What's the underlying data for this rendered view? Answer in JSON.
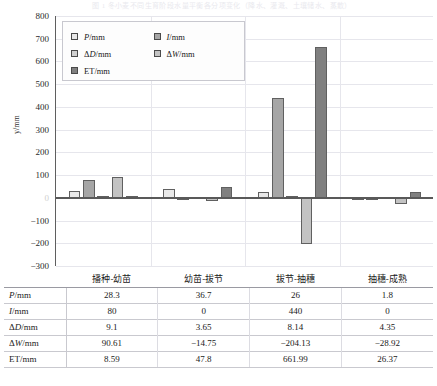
{
  "caption": "图 1  冬小麦不同生育阶段水量平衡各分项变化（降水、灌溉、土壤储水、蒸散）",
  "chart_data": {
    "type": "bar",
    "title": "",
    "xlabel": "",
    "ylabel": "y/mm",
    "ylim": [
      -300,
      800
    ],
    "ystep": 100,
    "grid": true,
    "legend_position": "top-left-inside",
    "categories": [
      "播种-幼苗",
      "幼苗-拔节",
      "拔节-抽穗",
      "抽穗-成熟"
    ],
    "yticks": [
      "800",
      "700",
      "600",
      "500",
      "400",
      "300",
      "200",
      "100",
      "0",
      "-100",
      "-200",
      "-300"
    ],
    "series": [
      {
        "name": "P/mm",
        "color": "#e8e8e8",
        "values": [
          28.3,
          36.7,
          26,
          1.8
        ]
      },
      {
        "name": "I/mm",
        "color": "#a6a6a6",
        "values": [
          80,
          0,
          440,
          0
        ]
      },
      {
        "name": "ΔD/mm",
        "color": "#d0d0d0",
        "values": [
          9.1,
          3.65,
          8.14,
          4.35
        ]
      },
      {
        "name": "ΔW/mm",
        "color": "#c3c3c3",
        "values": [
          90.61,
          -14.75,
          -204.13,
          -28.92
        ]
      },
      {
        "name": "ET/mm",
        "color": "#808080",
        "values": [
          8.59,
          47.8,
          661.99,
          26.37
        ]
      }
    ]
  },
  "legend": {
    "items": [
      {
        "label_html": "P/mm",
        "swatch": "#e8e8e8"
      },
      {
        "label_html": "I/mm",
        "swatch": "#a6a6a6"
      },
      {
        "label_html": "ΔD/mm",
        "swatch": "#d0d0d0"
      },
      {
        "label_html": "ΔW/mm",
        "swatch": "#c3c3c3"
      },
      {
        "label_html": "ET/mm",
        "swatch": "#808080"
      }
    ]
  },
  "table": {
    "corner": "",
    "columns": [
      "播种-幼苗",
      "幼苗-拔节",
      "拔节-抽穗",
      "抽穗-成熟"
    ],
    "rows": [
      {
        "label": "P/mm",
        "values": [
          "28.3",
          "36.7",
          "26",
          "1.8"
        ]
      },
      {
        "label": "I/mm",
        "values": [
          "80",
          "0",
          "440",
          "0"
        ]
      },
      {
        "label": "ΔD/mm",
        "values": [
          "9.1",
          "3.65",
          "8.14",
          "4.35"
        ]
      },
      {
        "label": "ΔW/mm",
        "values": [
          "90.61",
          "−14.75",
          "−204.13",
          "−28.92"
        ]
      },
      {
        "label": "ET/mm",
        "values": [
          "8.59",
          "47.8",
          "661.99",
          "26.37"
        ]
      }
    ]
  }
}
